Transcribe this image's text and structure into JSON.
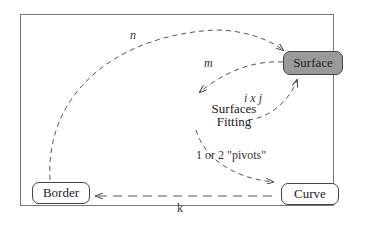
{
  "nodes": {
    "surface": "Surface",
    "border": "Border",
    "curve": "Curve",
    "fitting_line1": "Surfaces",
    "fitting_line2": "Fitting"
  },
  "edges": {
    "n": "n",
    "m": "m",
    "ixj": "i x j",
    "pivots": "1 or 2 \"pivots\"",
    "k": "k"
  },
  "colors": {
    "surface_fill": "#9a9a9a",
    "stroke": "#444444"
  }
}
